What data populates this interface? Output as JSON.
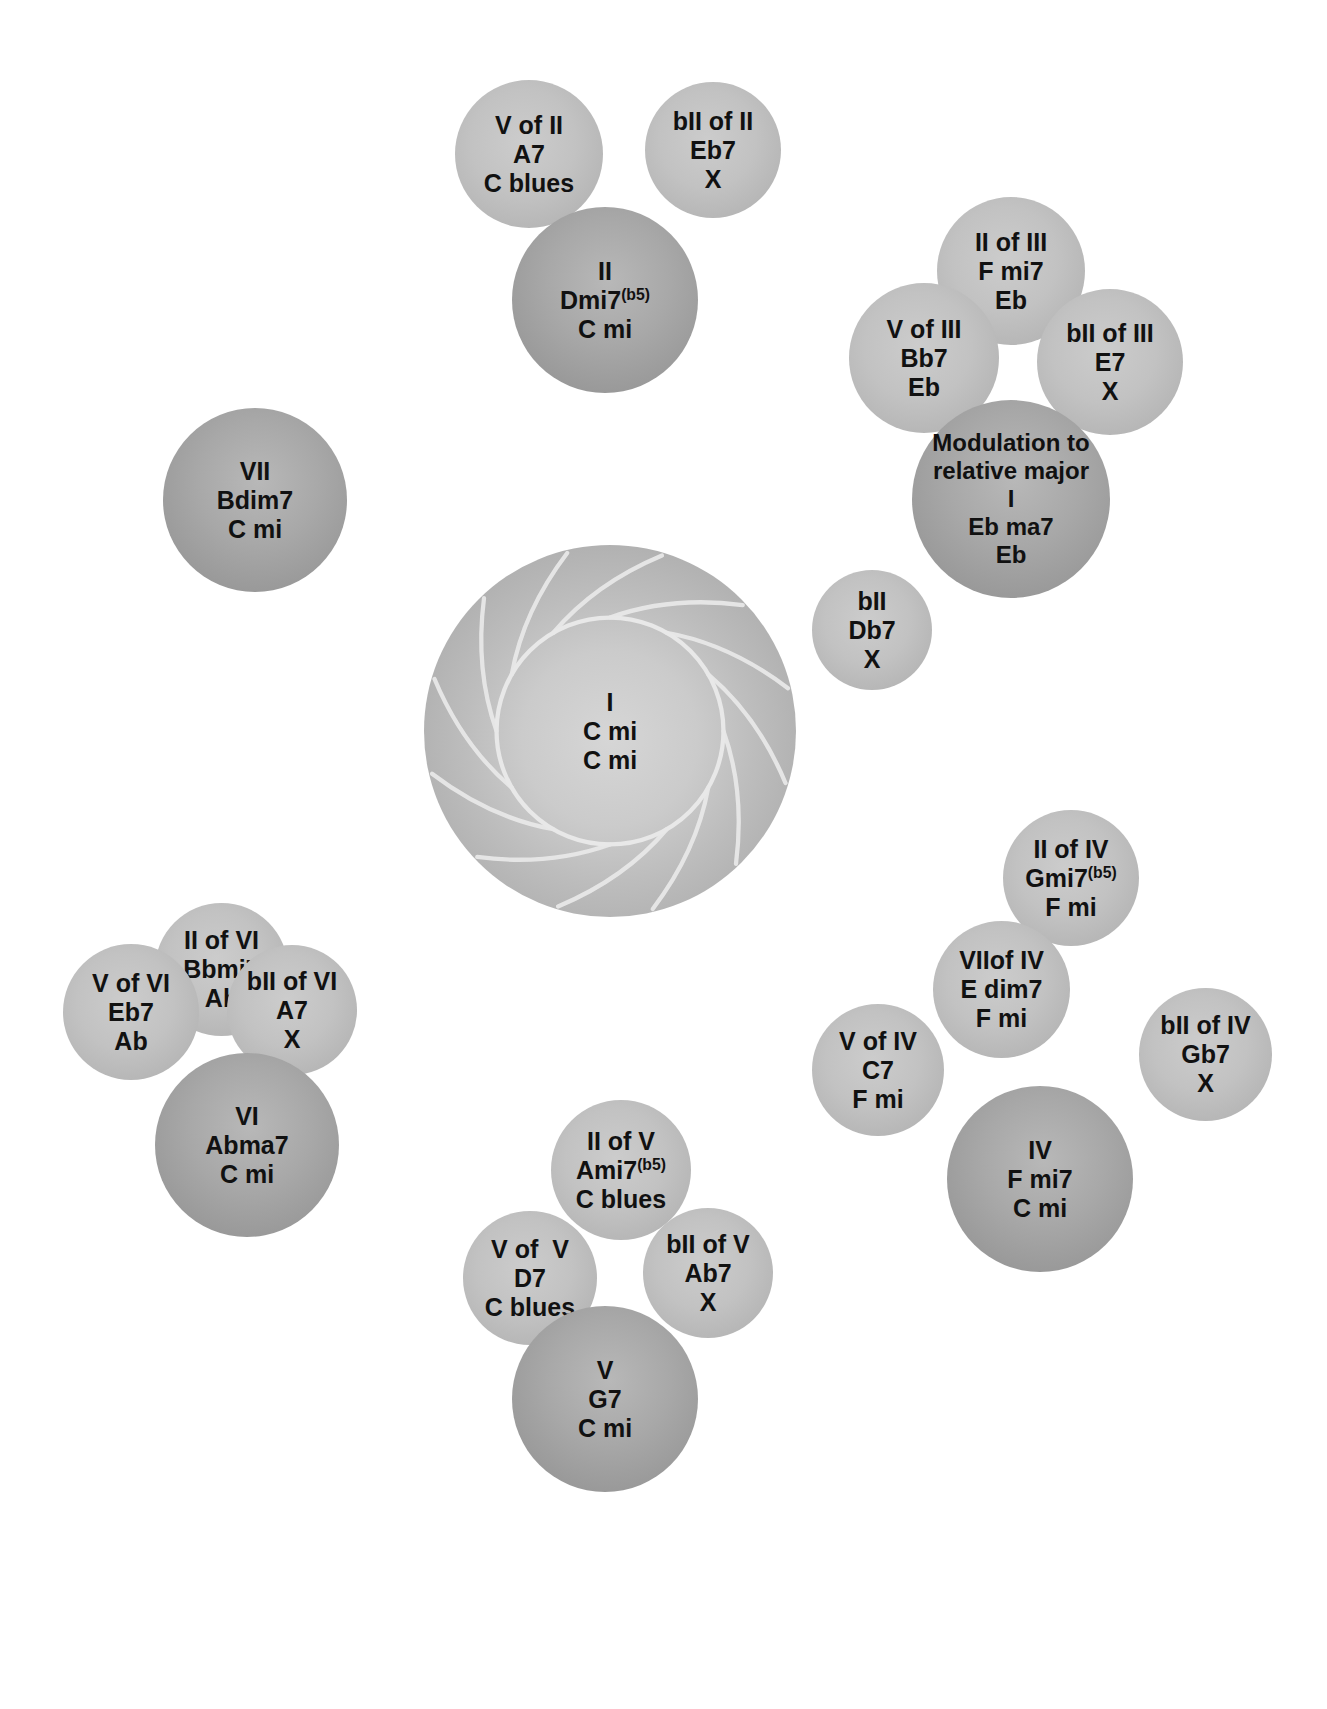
{
  "diagram": {
    "colors": {
      "background": "#ffffff",
      "satellite_fill": "#bfbfbf",
      "primary_fill": "#a6a6a6",
      "tonic_ring_line": "#e8e8e8",
      "text": "#111111"
    },
    "tonic": {
      "name": "tonic-center",
      "lines": [
        "I",
        "C mi",
        "C mi"
      ],
      "degree": "I",
      "chord": "C mi",
      "scale": "C mi"
    },
    "bubbles": [
      {
        "id": "v-of-ii",
        "kind": "satellite",
        "lines": [
          "V of II",
          "A7",
          "C blues"
        ],
        "degree": "V of II",
        "chord": "A7",
        "scale": "C blues",
        "x": 455,
        "y": 80,
        "d": 148
      },
      {
        "id": "bii-of-ii",
        "kind": "satellite",
        "lines": [
          "bII of II",
          "Eb7",
          "X"
        ],
        "degree": "bII of II",
        "chord": "Eb7",
        "scale": "X",
        "x": 645,
        "y": 82,
        "d": 136
      },
      {
        "id": "ii",
        "kind": "primary",
        "lines": [
          "II",
          "Dmi7(b5)",
          "C mi"
        ],
        "degree": "II",
        "chord": "Dmi7",
        "chord_sup": "(b5)",
        "scale": "C mi",
        "x": 512,
        "y": 207,
        "d": 186
      },
      {
        "id": "ii-of-iii",
        "kind": "satellite",
        "lines": [
          "II of III",
          "F mi7",
          "Eb"
        ],
        "degree": "II of III",
        "chord": "F mi7",
        "scale": "Eb",
        "x": 937,
        "y": 197,
        "d": 148
      },
      {
        "id": "v-of-iii",
        "kind": "satellite",
        "lines": [
          "V of III",
          "Bb7",
          "Eb"
        ],
        "degree": "V of III",
        "chord": "Bb7",
        "scale": "Eb",
        "x": 849,
        "y": 283,
        "d": 150
      },
      {
        "id": "bii-of-iii",
        "kind": "satellite",
        "lines": [
          "bII of III",
          "E7",
          "X"
        ],
        "degree": "bII of III",
        "chord": "E7",
        "scale": "X",
        "x": 1037,
        "y": 289,
        "d": 146
      },
      {
        "id": "iii-modulation",
        "kind": "primary",
        "lines": [
          "Modulation to",
          "relative major",
          "I",
          "Eb ma7",
          "Eb"
        ],
        "degree": "I",
        "chord": "Eb ma7",
        "scale": "Eb",
        "note": "Modulation to relative major",
        "x": 912,
        "y": 400,
        "d": 198
      },
      {
        "id": "vii",
        "kind": "primary",
        "lines": [
          "VII",
          "Bdim7",
          "C mi"
        ],
        "degree": "VII",
        "chord": "Bdim7",
        "scale": "C mi",
        "x": 163,
        "y": 408,
        "d": 184
      },
      {
        "id": "bii",
        "kind": "satellite",
        "lines": [
          "bII",
          "Db7",
          "X"
        ],
        "degree": "bII",
        "chord": "Db7",
        "scale": "X",
        "x": 812,
        "y": 570,
        "d": 120
      },
      {
        "id": "tonic",
        "kind": "tonic",
        "lines": [
          "I",
          "C mi",
          "C mi"
        ],
        "x": 424,
        "y": 545,
        "d": 372
      },
      {
        "id": "ii-of-vi",
        "kind": "satellite",
        "lines": [
          "II of VI",
          "Bbmi7",
          "Ab"
        ],
        "degree": "II of VI",
        "chord": "Bbmi7",
        "scale": "Ab",
        "x": 155,
        "y": 903,
        "d": 133
      },
      {
        "id": "ii-of-iv",
        "kind": "satellite",
        "lines": [
          "II of IV",
          "Gmi7(b5)",
          "F mi"
        ],
        "degree": "II of IV",
        "chord": "Gmi7",
        "chord_sup": "(b5)",
        "scale": "F mi",
        "x": 1003,
        "y": 810,
        "d": 136
      },
      {
        "id": "v-of-vi",
        "kind": "satellite",
        "lines": [
          "V of VI",
          "Eb7",
          "Ab"
        ],
        "degree": "V of VI",
        "chord": "Eb7",
        "scale": "Ab",
        "x": 63,
        "y": 944,
        "d": 136
      },
      {
        "id": "bii-of-vi",
        "kind": "satellite",
        "lines": [
          "bII of VI",
          "A7",
          "X"
        ],
        "degree": "bII of VI",
        "chord": "A7",
        "scale": "X",
        "x": 227,
        "y": 945,
        "d": 130
      },
      {
        "id": "vii-of-iv",
        "kind": "satellite",
        "lines": [
          "VIIof IV",
          "E dim7",
          "F mi"
        ],
        "degree": "VIIof IV",
        "chord": "E dim7",
        "scale": "F mi",
        "x": 933,
        "y": 921,
        "d": 137
      },
      {
        "id": "v-of-iv",
        "kind": "satellite",
        "lines": [
          "V of IV",
          "C7",
          "F mi"
        ],
        "degree": "V of IV",
        "chord": "C7",
        "scale": "F mi",
        "x": 812,
        "y": 1004,
        "d": 132
      },
      {
        "id": "bii-of-iv",
        "kind": "satellite",
        "lines": [
          "bII of IV",
          "Gb7",
          "X"
        ],
        "degree": "bII of IV",
        "chord": "Gb7",
        "scale": "X",
        "x": 1139,
        "y": 988,
        "d": 133
      },
      {
        "id": "vi",
        "kind": "primary",
        "lines": [
          "VI",
          "Abma7",
          "C mi"
        ],
        "degree": "VI",
        "chord": "Abma7",
        "scale": "C mi",
        "x": 155,
        "y": 1053,
        "d": 184
      },
      {
        "id": "iv",
        "kind": "primary",
        "lines": [
          "IV",
          "F mi7",
          "C mi"
        ],
        "degree": "IV",
        "chord": "F mi7",
        "scale": "C mi",
        "x": 947,
        "y": 1086,
        "d": 186
      },
      {
        "id": "ii-of-v",
        "kind": "satellite",
        "lines": [
          "II of V",
          "Ami7(b5)",
          "C blues"
        ],
        "degree": "II of V",
        "chord": "Ami7",
        "chord_sup": "(b5)",
        "scale": "C blues",
        "x": 551,
        "y": 1100,
        "d": 140
      },
      {
        "id": "v-of-v",
        "kind": "satellite",
        "lines": [
          "V of  V",
          "D7",
          "C blues"
        ],
        "degree": "V of  V",
        "chord": "D7",
        "scale": "C blues",
        "x": 463,
        "y": 1211,
        "d": 134
      },
      {
        "id": "bii-of-v",
        "kind": "satellite",
        "lines": [
          "bII of V",
          "Ab7",
          "X"
        ],
        "degree": "bII of V",
        "chord": "Ab7",
        "scale": "X",
        "x": 643,
        "y": 1208,
        "d": 130
      },
      {
        "id": "v",
        "kind": "primary",
        "lines": [
          "V",
          "G7",
          "C mi"
        ],
        "degree": "V",
        "chord": "G7",
        "scale": "C mi",
        "x": 512,
        "y": 1306,
        "d": 186
      }
    ]
  }
}
